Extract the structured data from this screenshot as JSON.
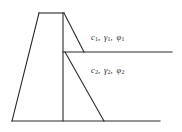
{
  "figure": {
    "type": "engineering-diagram",
    "background_color": "#ffffff",
    "line_color": "#2b2b2b"
  },
  "labels": {
    "layer_1": {
      "cohesion": "c",
      "cohesion_sub": "1",
      "unit_weight": "γ",
      "unit_weight_sub": "1",
      "friction_angle": "φ",
      "friction_angle_sub": "1",
      "separator": ",",
      "text": "c₁, γ₁, φ₁"
    },
    "layer_2": {
      "cohesion": "c",
      "cohesion_sub": "2",
      "unit_weight": "γ",
      "unit_weight_sub": "2",
      "friction_angle": "φ",
      "friction_angle_sub": "2",
      "separator": ",",
      "text": "c₂, γ₂, φ₂"
    }
  },
  "geometry": {
    "wall_top_edge": {
      "x1": 39,
      "y1": 13,
      "x2": 64,
      "y2": 13
    },
    "wall_front_face": {
      "x1": 39,
      "y1": 13,
      "x2": 12,
      "y2": 121
    },
    "wall_back_face": {
      "x1": 63,
      "y1": 13,
      "x2": 63,
      "y2": 121
    },
    "ground_line_bottom": {
      "x1": 12,
      "y1": 121,
      "x2": 160,
      "y2": 121
    },
    "ground_line_middle": {
      "x1": 63,
      "y1": 52,
      "x2": 172,
      "y2": 52
    },
    "failure_plane_upper": {
      "x1": 64,
      "y1": 13,
      "x2": 84,
      "y2": 52
    },
    "failure_plane_lower": {
      "x1": 65,
      "y1": 52,
      "x2": 104,
      "y2": 121
    }
  }
}
